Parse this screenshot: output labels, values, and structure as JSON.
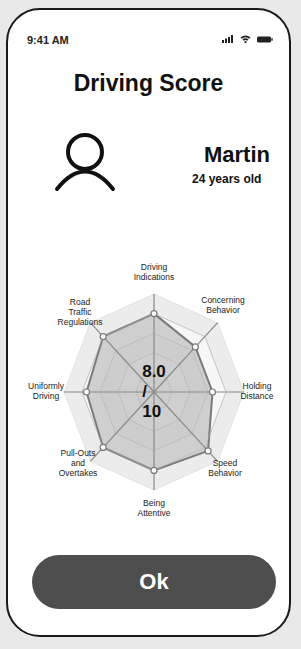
{
  "status_bar": {
    "time": "9:41 AM",
    "icons": [
      "signal-icon",
      "wifi-icon",
      "battery-icon"
    ]
  },
  "header": {
    "title": "Driving Score"
  },
  "profile": {
    "avatar_icon": "user-icon",
    "name": "Martin",
    "age": "24 years old"
  },
  "score": {
    "text": "8.0 / 10",
    "value": 8.0,
    "max": 10
  },
  "chart_data": {
    "type": "radar",
    "title": "",
    "max": 10,
    "categories": [
      "Driving Indications",
      "Concerning Behavior",
      "Holding Distance",
      "Speed Behavior",
      "Being Attentive",
      "Pull-Outs and Overtakes",
      "Uniformly Driving",
      "Road Traffic Regulations"
    ],
    "labels_display": [
      "Driving\nIndications",
      "Concerning\nBehavior",
      "Holding\nDistance",
      "Speed\nBehavior",
      "Being\nAttentive",
      "Pull-Outs and\nOvertakes",
      "Uniformly\nDriving",
      "Road Traffic\nRegulations"
    ],
    "values": [
      8.0,
      6.5,
      6.5,
      8.5,
      8.0,
      8.0,
      7.5,
      8.0
    ],
    "center_label": "8.0 / 10",
    "grid": true,
    "rings": 5
  },
  "actions": {
    "ok_label": "Ok"
  },
  "colors": {
    "button_bg": "#4e4e4e",
    "data_fill": "#c8c8c8",
    "data_stroke": "#7a7a7a",
    "band": "#ececec"
  }
}
